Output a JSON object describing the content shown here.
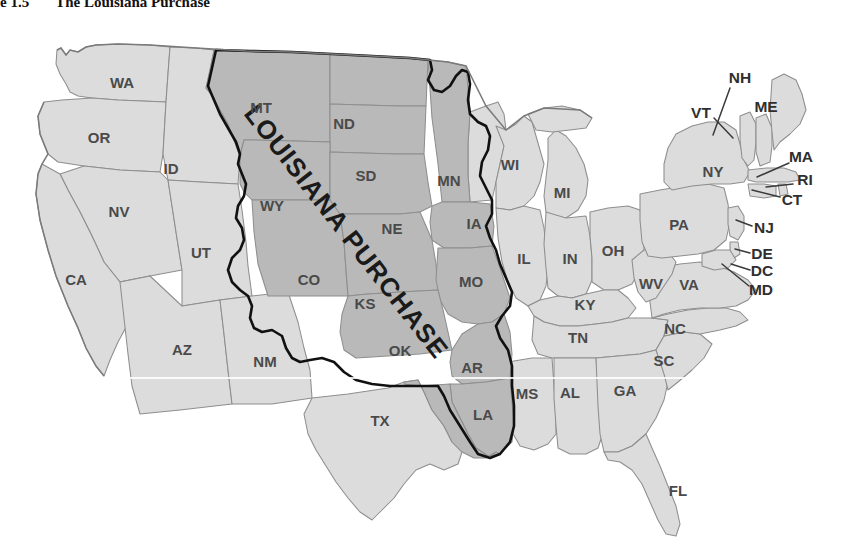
{
  "figure": {
    "number": "e 1.5",
    "title": "The Louisiana Purchase"
  },
  "map": {
    "name": "united-states-louisiana-purchase-map",
    "overlay_label": "LOUISIANA PURCHASE",
    "colors": {
      "purchase_fill": "#b9b9b9",
      "other_states_fill": "#dcdcdc",
      "state_border": "#8e8e8e",
      "purchase_border": "#111111",
      "label_text": "#4a4a4a",
      "background": "#ffffff"
    },
    "legend_note": "",
    "inside_labels": [
      {
        "abbr": "MT",
        "x": 261,
        "y": 95
      },
      {
        "abbr": "ND",
        "x": 344,
        "y": 111
      },
      {
        "abbr": "SD",
        "x": 366,
        "y": 163
      },
      {
        "abbr": "MN",
        "x": 449,
        "y": 168
      },
      {
        "abbr": "WY",
        "x": 272,
        "y": 193
      },
      {
        "abbr": "NE",
        "x": 392,
        "y": 216
      },
      {
        "abbr": "IA",
        "x": 474,
        "y": 211
      },
      {
        "abbr": "CO",
        "x": 309,
        "y": 267
      },
      {
        "abbr": "KS",
        "x": 365,
        "y": 291
      },
      {
        "abbr": "MO",
        "x": 471,
        "y": 269
      },
      {
        "abbr": "OK",
        "x": 400,
        "y": 338
      },
      {
        "abbr": "AR",
        "x": 472,
        "y": 355
      },
      {
        "abbr": "LA",
        "x": 483,
        "y": 402
      },
      {
        "abbr": "WA",
        "x": 122,
        "y": 70
      },
      {
        "abbr": "OR",
        "x": 99,
        "y": 125
      },
      {
        "abbr": "ID",
        "x": 171,
        "y": 156
      },
      {
        "abbr": "NV",
        "x": 119,
        "y": 199
      },
      {
        "abbr": "UT",
        "x": 201,
        "y": 240
      },
      {
        "abbr": "CA",
        "x": 76,
        "y": 267
      },
      {
        "abbr": "AZ",
        "x": 182,
        "y": 337
      },
      {
        "abbr": "NM",
        "x": 265,
        "y": 349
      },
      {
        "abbr": "TX",
        "x": 380,
        "y": 408
      },
      {
        "abbr": "WI",
        "x": 510,
        "y": 152
      },
      {
        "abbr": "MI",
        "x": 562,
        "y": 180
      },
      {
        "abbr": "IL",
        "x": 524,
        "y": 246
      },
      {
        "abbr": "IN",
        "x": 570,
        "y": 246
      },
      {
        "abbr": "OH",
        "x": 613,
        "y": 238
      },
      {
        "abbr": "KY",
        "x": 585,
        "y": 292
      },
      {
        "abbr": "TN",
        "x": 578,
        "y": 325
      },
      {
        "abbr": "MS",
        "x": 527,
        "y": 381
      },
      {
        "abbr": "AL",
        "x": 570,
        "y": 380
      },
      {
        "abbr": "GA",
        "x": 625,
        "y": 378
      },
      {
        "abbr": "SC",
        "x": 664,
        "y": 348
      },
      {
        "abbr": "NC",
        "x": 675,
        "y": 316
      },
      {
        "abbr": "VA",
        "x": 689,
        "y": 272
      },
      {
        "abbr": "WV",
        "x": 651,
        "y": 271
      },
      {
        "abbr": "PA",
        "x": 679,
        "y": 212
      },
      {
        "abbr": "NY",
        "x": 713,
        "y": 159
      },
      {
        "abbr": "FL",
        "x": 678,
        "y": 478
      }
    ],
    "callout_labels": [
      {
        "abbr": "NH",
        "x": 740,
        "y": 65,
        "lx": 730,
        "ly": 74,
        "tx": 713,
        "ty": 121
      },
      {
        "abbr": "VT",
        "x": 701,
        "y": 100,
        "lx": 714,
        "ly": 104,
        "tx": 733,
        "ty": 124
      },
      {
        "abbr": "ME",
        "x": 766,
        "y": 94,
        "lx": 766,
        "ly": 94,
        "tx": 766,
        "ty": 94
      },
      {
        "abbr": "MA",
        "x": 801,
        "y": 144,
        "lx": 789,
        "ly": 149,
        "tx": 757,
        "ty": 163
      },
      {
        "abbr": "RI",
        "x": 805,
        "y": 167,
        "lx": 793,
        "ly": 170,
        "tx": 766,
        "ty": 173
      },
      {
        "abbr": "CT",
        "x": 792,
        "y": 187,
        "lx": 780,
        "ly": 183,
        "tx": 752,
        "ty": 176
      },
      {
        "abbr": "NJ",
        "x": 764,
        "y": 215,
        "lx": 752,
        "ly": 212,
        "tx": 736,
        "ty": 206
      },
      {
        "abbr": "DE",
        "x": 762,
        "y": 241,
        "lx": 750,
        "ly": 239,
        "tx": 735,
        "ty": 235
      },
      {
        "abbr": "DC",
        "x": 762,
        "y": 258,
        "lx": 750,
        "ly": 256,
        "tx": 731,
        "ty": 250
      },
      {
        "abbr": "MD",
        "x": 761,
        "y": 277,
        "lx": 749,
        "ly": 272,
        "tx": 722,
        "ty": 250
      }
    ]
  }
}
